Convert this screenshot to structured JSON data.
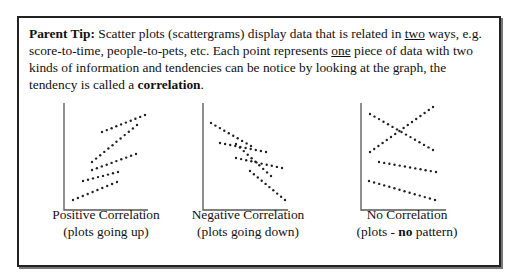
{
  "tip": {
    "label": "Parent Tip:",
    "text_1": " Scatter plots (scattergrams) display data that is related in ",
    "underline_1": "two",
    "text_2": " ways, e.g. score-to-time, people-to-pets, etc. Each point represents ",
    "underline_2": "one",
    "text_3": " piece of data with two kinds of information and tendencies can be notice by looking at the graph, the tendency is called a ",
    "bold_term": "correlation",
    "text_4": "."
  },
  "captions": [
    {
      "line1": "Positive Correlation",
      "line2": "(plots going up)"
    },
    {
      "line1": "Negative Correlation",
      "line2": "(plots going down)"
    },
    {
      "line1": "No Correlation",
      "line2_a": "(plots - ",
      "line2_bold": "no",
      "line2_b": " pattern)"
    }
  ],
  "chart_data": [
    {
      "type": "scatter",
      "title": "Positive Correlation",
      "subtitle": "(plots going up)",
      "xlabel": "",
      "ylabel": "",
      "grid": false,
      "series": [
        {
          "name": "line1",
          "from": [
            73,
            200
          ],
          "to": [
            117,
            182
          ]
        },
        {
          "name": "line2",
          "from": [
            83,
            181
          ],
          "to": [
            118,
            172
          ]
        },
        {
          "name": "line3",
          "from": [
            92,
            170
          ],
          "to": [
            136,
            154
          ]
        },
        {
          "name": "line4",
          "from": [
            92,
            162
          ],
          "to": [
            137,
            125
          ]
        },
        {
          "name": "line5",
          "from": [
            102,
            132
          ],
          "to": [
            145,
            115
          ]
        }
      ]
    },
    {
      "type": "scatter",
      "title": "Negative Correlation",
      "subtitle": "(plots going down)",
      "xlabel": "",
      "ylabel": "",
      "grid": false,
      "series": [
        {
          "name": "line1",
          "from": [
            211,
            123
          ],
          "to": [
            251,
            146
          ]
        },
        {
          "name": "line2",
          "from": [
            220,
            143
          ],
          "to": [
            266,
            152
          ]
        },
        {
          "name": "line3",
          "from": [
            236,
            144
          ],
          "to": [
            271,
            176
          ]
        },
        {
          "name": "line4",
          "from": [
            236,
            158
          ],
          "to": [
            282,
            168
          ]
        },
        {
          "name": "line5",
          "from": [
            250,
            171
          ],
          "to": [
            285,
            200
          ]
        }
      ]
    },
    {
      "type": "scatter",
      "title": "No Correlation",
      "subtitle": "(plots - no pattern)",
      "xlabel": "",
      "ylabel": "",
      "grid": false,
      "series": [
        {
          "name": "line1",
          "from": [
            370,
            114
          ],
          "to": [
            433,
            150
          ]
        },
        {
          "name": "line2",
          "from": [
            370,
            152
          ],
          "to": [
            433,
            107
          ]
        },
        {
          "name": "line3",
          "from": [
            379,
            162
          ],
          "to": [
            436,
            172
          ]
        },
        {
          "name": "line4",
          "from": [
            369,
            181
          ],
          "to": [
            435,
            200
          ]
        }
      ]
    }
  ],
  "axes": [
    {
      "x": 64,
      "top": 103,
      "bottom": 210,
      "right": 148
    },
    {
      "x": 203,
      "top": 103,
      "bottom": 210,
      "right": 288
    },
    {
      "x": 361,
      "top": 103,
      "bottom": 210,
      "right": 446
    }
  ]
}
